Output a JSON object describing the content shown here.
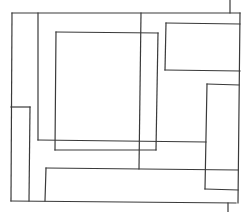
{
  "diagram": {
    "title": "",
    "stroke_color": "#3a3a3a",
    "background": "#ffffff",
    "segments": [
      {
        "id": "outer-top",
        "x1": 12,
        "y1": 13,
        "x2": 240,
        "y2": 13
      },
      {
        "id": "outer-left",
        "x1": 12,
        "y1": 13,
        "x2": 11,
        "y2": 201
      },
      {
        "id": "outer-bottom",
        "x1": 11,
        "y1": 201,
        "x2": 236,
        "y2": 203
      },
      {
        "id": "outer-right",
        "x1": 240,
        "y1": 13,
        "x2": 238,
        "y2": 203
      },
      {
        "id": "top-stub",
        "x1": 230,
        "y1": 0,
        "x2": 230,
        "y2": 13
      },
      {
        "id": "bottom-stub",
        "x1": 228,
        "y1": 203,
        "x2": 228,
        "y2": 212
      },
      {
        "id": "v-38",
        "x1": 38,
        "y1": 13,
        "x2": 38,
        "y2": 140
      },
      {
        "id": "h-140",
        "x1": 38,
        "y1": 140,
        "x2": 206,
        "y2": 142
      },
      {
        "id": "inner-left",
        "x1": 56,
        "y1": 32,
        "x2": 55,
        "y2": 150
      },
      {
        "id": "inner-top",
        "x1": 56,
        "y1": 32,
        "x2": 158,
        "y2": 33
      },
      {
        "id": "inner-right",
        "x1": 158,
        "y1": 33,
        "x2": 156,
        "y2": 150
      },
      {
        "id": "inner-bottom",
        "x1": 55,
        "y1": 150,
        "x2": 156,
        "y2": 150
      },
      {
        "id": "v-141",
        "x1": 141,
        "y1": 13,
        "x2": 139,
        "y2": 169
      },
      {
        "id": "tr-left",
        "x1": 166,
        "y1": 23,
        "x2": 165,
        "y2": 70
      },
      {
        "id": "tr-top",
        "x1": 166,
        "y1": 23,
        "x2": 240,
        "y2": 24
      },
      {
        "id": "tr-bottom",
        "x1": 165,
        "y1": 70,
        "x2": 240,
        "y2": 71
      },
      {
        "id": "small-left-top",
        "x1": 11,
        "y1": 107,
        "x2": 30,
        "y2": 107
      },
      {
        "id": "small-left-right",
        "x1": 30,
        "y1": 107,
        "x2": 29,
        "y2": 201
      },
      {
        "id": "lower-left",
        "x1": 46,
        "y1": 168,
        "x2": 45,
        "y2": 201
      },
      {
        "id": "lower-top",
        "x1": 46,
        "y1": 168,
        "x2": 238,
        "y2": 170
      },
      {
        "id": "right-rect-top",
        "x1": 207,
        "y1": 84,
        "x2": 239,
        "y2": 85
      },
      {
        "id": "right-rect-left",
        "x1": 207,
        "y1": 84,
        "x2": 205,
        "y2": 189
      },
      {
        "id": "right-rect-bottom",
        "x1": 205,
        "y1": 189,
        "x2": 238,
        "y2": 190
      }
    ]
  }
}
